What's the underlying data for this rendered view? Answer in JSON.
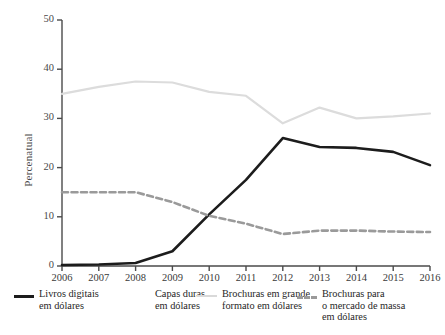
{
  "chart_data": {
    "type": "line",
    "title": "",
    "subtitle": "",
    "xlabel": "",
    "ylabel": "Percenatual",
    "x": [
      2006,
      2007,
      2008,
      2009,
      2010,
      2011,
      2012,
      2013,
      2014,
      2015,
      2016
    ],
    "categories": [
      "2006",
      "2007",
      "2008",
      "2009",
      "2010",
      "2011",
      "2012",
      "2013",
      "2014",
      "2015",
      "2016"
    ],
    "xlim": [
      2006,
      2016
    ],
    "ylim": [
      0,
      50
    ],
    "yticks": [
      0,
      10,
      20,
      30,
      40,
      50
    ],
    "grid": false,
    "legend_position": "bottom",
    "series": [
      {
        "name": "Livros digitais em dólares",
        "legend_label": "Livros digitais\nem dólares",
        "color": "#1c1c1c",
        "style": "solid",
        "width": 2.6,
        "values": [
          0.2,
          0.3,
          0.6,
          3.0,
          10.5,
          17.5,
          26.0,
          24.2,
          24.0,
          23.2,
          20.5
        ]
      },
      {
        "name": "Capas duras em dólares",
        "legend_label": "Capas duras\nem dólares",
        "color": "#ffffff",
        "style": "solid",
        "width": 2.0,
        "values": [
          null,
          null,
          null,
          null,
          null,
          null,
          null,
          null,
          null,
          null,
          null
        ]
      },
      {
        "name": "Brochuras em grande formato em dólares",
        "legend_label": "Brochuras em grande\nformato em dólares",
        "color": "#dcdcdc",
        "style": "solid",
        "width": 2.2,
        "values": [
          35.0,
          36.4,
          37.5,
          37.3,
          35.4,
          34.6,
          29.0,
          32.2,
          30.0,
          30.4,
          31.0
        ]
      },
      {
        "name": "Brochuras para o mercado de massa em dólares",
        "legend_label": "Brochuras para\no mercado de massa\nem dólares",
        "color": "#9a9a9a",
        "style": "dashed",
        "width": 2.6,
        "values": [
          15.0,
          15.0,
          15.0,
          13.0,
          10.2,
          8.6,
          6.5,
          7.2,
          7.2,
          7.0,
          6.9
        ]
      }
    ]
  },
  "axis": {
    "y_tick_labels": [
      "50",
      "40",
      "30",
      "20",
      "10",
      "0"
    ],
    "x_tick_labels": [
      "2006",
      "2007",
      "2008",
      "2009",
      "2010",
      "2011",
      "2012",
      "2013",
      "2014",
      "2015",
      "2016"
    ],
    "y_axis_title": "Percenatual"
  },
  "legend": {
    "items": [
      {
        "label": "Livros digitais\nem dólares",
        "swatch": "solid-black"
      },
      {
        "label": "Capas duras\nem dólares",
        "swatch": "none"
      },
      {
        "label": "Brochuras em grande\nformato em dólares",
        "swatch": "solid-light"
      },
      {
        "label": "Brochuras para\no mercado de massa\nem dólares",
        "swatch": "dash-gray"
      }
    ]
  },
  "colors": {
    "ebook": "#1c1c1c",
    "hardcover": "#ffffff",
    "trade_paperback": "#dcdcdc",
    "mass_market": "#9a9a9a",
    "axis": "#4a4a4a",
    "background": "#ffffff"
  }
}
